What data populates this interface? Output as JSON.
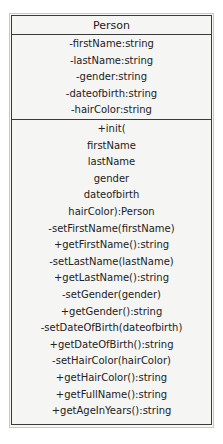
{
  "diagram": {
    "type": "uml-class",
    "class_name": "Person",
    "attributes": [
      "-firstName:string",
      "-lastName:string",
      "-gender:string",
      "-dateofbirth:string",
      "-hairColor:string"
    ],
    "methods": [
      "+init(",
      "firstName",
      "lastName",
      "gender",
      "dateofbirth",
      "hairColor):Person",
      "-setFirstName(firstName)",
      "+getFirstName():string",
      "-setLastName(lastName)",
      "+getLastName():string",
      "-setGender(gender)",
      "+getGender():string",
      "-setDateOfBirth(dateofbirth)",
      "+getDateOfBirth():string",
      "-setHairColor(hairColor)",
      "+getHairColor():string",
      "+getFullName():string",
      "+getAgeInYears():string"
    ]
  }
}
